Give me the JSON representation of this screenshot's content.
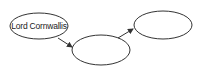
{
  "diagram": {
    "type": "flow-chain",
    "nodes": [
      {
        "id": "node-1",
        "label": "Lord Cornwallis",
        "shape": "ellipse"
      },
      {
        "id": "node-2",
        "label": "",
        "shape": "ellipse"
      },
      {
        "id": "node-3",
        "label": "",
        "shape": "ellipse"
      }
    ],
    "edges": [
      {
        "from": "node-1",
        "to": "node-2"
      },
      {
        "from": "node-2",
        "to": "node-3"
      }
    ],
    "colors": {
      "stroke": "#333333",
      "background": "#ffffff",
      "text": "#222222"
    }
  }
}
